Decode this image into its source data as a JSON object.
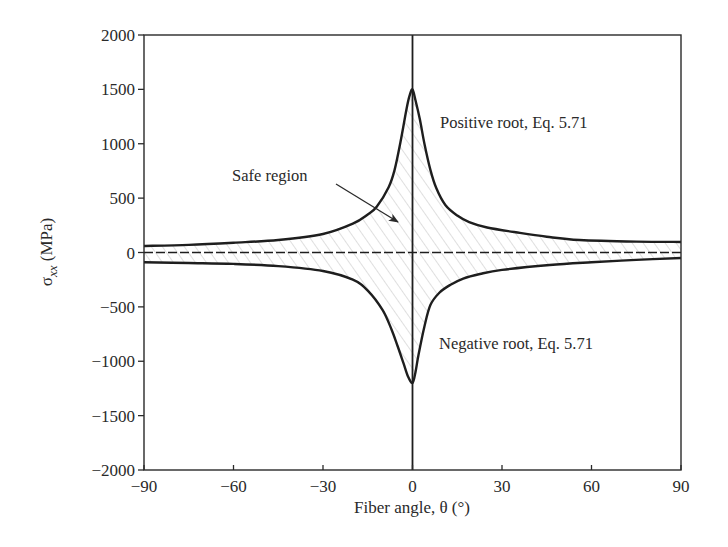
{
  "chart_data": {
    "type": "line",
    "title": "",
    "xlabel": "Fiber angle, θ (°)",
    "ylabel": "σ_xx (MPa)",
    "ylabel_parts": {
      "symbol": "σ",
      "subscript": "xx",
      "unit": " (MPa)"
    },
    "xlim": [
      -90,
      90
    ],
    "ylim": [
      -2000,
      2000
    ],
    "xticks": [
      -90,
      -60,
      -30,
      0,
      30,
      60,
      90
    ],
    "xtick_labels": [
      "−90",
      "−60",
      "−30",
      "0",
      "30",
      "60",
      "90"
    ],
    "yticks": [
      2000,
      1500,
      1000,
      500,
      0,
      -500,
      -1000,
      -1500,
      -2000
    ],
    "ytick_labels": [
      "2000",
      "1500",
      "1000",
      "500",
      "0",
      "−500",
      "−1000",
      "−1500",
      "−2000"
    ],
    "grid": false,
    "reference_lines": {
      "horizontal_dashed_at": 0,
      "vertical_solid_at": 0
    },
    "series": [
      {
        "name": "Positive root, Eq. 5.71",
        "x": [
          -90,
          -75,
          -60,
          -45,
          -30,
          -20,
          -15,
          -12,
          -8,
          -6,
          -4,
          -2,
          -1,
          0,
          1,
          2.5,
          4,
          6,
          8,
          11,
          15,
          19,
          25,
          36,
          45,
          56,
          75,
          90
        ],
        "values": [
          60,
          70,
          90,
          115,
          170,
          265,
          350,
          420,
          600,
          760,
          1020,
          1320,
          1440,
          1500,
          1400,
          1220,
          1000,
          760,
          590,
          437,
          340,
          280,
          230,
          180,
          145,
          115,
          100,
          97
        ]
      },
      {
        "name": "Negative root, Eq. 5.71",
        "x": [
          -90,
          -75,
          -60,
          -45,
          -30,
          -20,
          -15,
          -10,
          -7,
          -5,
          -3,
          -1.5,
          0,
          1,
          2,
          4,
          6,
          9,
          12.6,
          17,
          22.6,
          30,
          46,
          60,
          75,
          90
        ],
        "values": [
          -90,
          -97,
          -105,
          -125,
          -170,
          -250,
          -350,
          -530,
          -710,
          -860,
          -1020,
          -1140,
          -1200,
          -1100,
          -943,
          -680,
          -483,
          -370,
          -299,
          -240,
          -198,
          -160,
          -115,
          -90,
          -68,
          -51
        ]
      }
    ],
    "shaded_region": {
      "label": "Safe region",
      "between": [
        "Positive root, Eq. 5.71",
        "Negative root, Eq. 5.71"
      ],
      "pattern": "diagonal-hatch"
    },
    "annotations": [
      {
        "text": "Positive root, Eq. 5.71",
        "x": 15,
        "y": 1000
      },
      {
        "text": "Negative root, Eq. 5.71",
        "x": 15,
        "y": -850
      },
      {
        "text": "Safe region",
        "x": -52,
        "y": 700,
        "arrow_to": [
          -5,
          290
        ]
      }
    ],
    "colors": {
      "line": "#1e1e1e",
      "hatch": "#b8b8b8",
      "frame": "#2a2a2a"
    }
  }
}
